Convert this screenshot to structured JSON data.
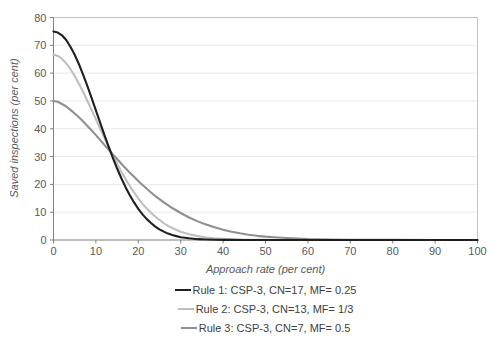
{
  "chart_data": {
    "type": "line",
    "title": "",
    "xlabel": "Approach rate (per cent)",
    "ylabel": "Saved inspections (per cent)",
    "xlim": [
      0,
      100
    ],
    "ylim": [
      0,
      80
    ],
    "x_ticks": [
      0,
      10,
      20,
      30,
      40,
      50,
      60,
      70,
      80,
      90,
      100
    ],
    "y_ticks": [
      0,
      10,
      20,
      30,
      40,
      50,
      60,
      70,
      80
    ],
    "grid": "horizontal-faint",
    "legend_position": "bottom-stacked-centered",
    "series": [
      {
        "name": "Rule 1: CSP-3, CN=17, MF= 0.25",
        "color": "#1f1f1f",
        "points": [
          [
            0,
            75
          ],
          [
            1,
            74.6
          ],
          [
            2,
            73.6
          ],
          [
            3,
            71.9
          ],
          [
            4,
            69.5
          ],
          [
            5,
            66.6
          ],
          [
            6,
            63.2
          ],
          [
            7,
            59.4
          ],
          [
            8,
            55.3
          ],
          [
            9,
            51.0
          ],
          [
            10,
            46.6
          ],
          [
            11,
            42.2
          ],
          [
            12,
            37.8
          ],
          [
            13,
            33.6
          ],
          [
            14,
            29.5
          ],
          [
            15,
            25.7
          ],
          [
            16,
            22.2
          ],
          [
            17,
            19.0
          ],
          [
            18,
            16.1
          ],
          [
            19,
            13.5
          ],
          [
            20,
            11.2
          ],
          [
            21,
            9.2
          ],
          [
            22,
            7.5
          ],
          [
            23,
            6.1
          ],
          [
            24,
            4.8
          ],
          [
            25,
            3.8
          ],
          [
            26,
            3.0
          ],
          [
            27,
            2.3
          ],
          [
            28,
            1.8
          ],
          [
            29,
            1.4
          ],
          [
            30,
            1.0
          ],
          [
            32,
            0.6
          ],
          [
            34,
            0.3
          ],
          [
            36,
            0.2
          ],
          [
            38,
            0.1
          ],
          [
            40,
            0.05
          ],
          [
            45,
            0
          ],
          [
            50,
            0
          ],
          [
            60,
            0
          ],
          [
            70,
            0
          ],
          [
            80,
            0
          ],
          [
            90,
            0
          ],
          [
            100,
            0
          ]
        ]
      },
      {
        "name": "Rule 2: CSP-3, CN=13, MF= 1/3",
        "color": "#bfbfbf",
        "points": [
          [
            0,
            66.7
          ],
          [
            1,
            66.2
          ],
          [
            2,
            65.1
          ],
          [
            3,
            63.5
          ],
          [
            4,
            61.4
          ],
          [
            5,
            59.0
          ],
          [
            6,
            56.2
          ],
          [
            7,
            53.2
          ],
          [
            8,
            50.0
          ],
          [
            9,
            46.8
          ],
          [
            10,
            43.4
          ],
          [
            11,
            40.1
          ],
          [
            12,
            36.8
          ],
          [
            13,
            33.5
          ],
          [
            14,
            30.4
          ],
          [
            15,
            27.4
          ],
          [
            16,
            24.5
          ],
          [
            17,
            21.9
          ],
          [
            18,
            19.4
          ],
          [
            19,
            17.1
          ],
          [
            20,
            15.0
          ],
          [
            21,
            13.0
          ],
          [
            22,
            11.3
          ],
          [
            23,
            9.8
          ],
          [
            24,
            8.4
          ],
          [
            25,
            7.2
          ],
          [
            26,
            6.1
          ],
          [
            27,
            5.1
          ],
          [
            28,
            4.3
          ],
          [
            29,
            3.6
          ],
          [
            30,
            3.0
          ],
          [
            32,
            2.1
          ],
          [
            34,
            1.4
          ],
          [
            36,
            0.9
          ],
          [
            38,
            0.6
          ],
          [
            40,
            0.4
          ],
          [
            45,
            0.1
          ],
          [
            50,
            0.05
          ],
          [
            55,
            0
          ],
          [
            60,
            0
          ],
          [
            70,
            0
          ],
          [
            80,
            0
          ],
          [
            90,
            0
          ],
          [
            100,
            0
          ]
        ]
      },
      {
        "name": "Rule 3: CSP-3, CN=7, MF= 0.5",
        "color": "#8f8f8f",
        "points": [
          [
            0,
            50
          ],
          [
            1,
            49.7
          ],
          [
            2,
            48.9
          ],
          [
            3,
            48.0
          ],
          [
            4,
            46.8
          ],
          [
            5,
            45.5
          ],
          [
            6,
            44.1
          ],
          [
            7,
            42.6
          ],
          [
            8,
            41.0
          ],
          [
            9,
            39.4
          ],
          [
            10,
            37.7
          ],
          [
            11,
            36.0
          ],
          [
            12,
            34.2
          ],
          [
            13,
            32.5
          ],
          [
            14,
            30.8
          ],
          [
            15,
            29.1
          ],
          [
            16,
            27.4
          ],
          [
            17,
            25.8
          ],
          [
            18,
            24.2
          ],
          [
            19,
            22.7
          ],
          [
            20,
            21.2
          ],
          [
            21,
            19.8
          ],
          [
            22,
            18.4
          ],
          [
            23,
            17.1
          ],
          [
            24,
            15.8
          ],
          [
            25,
            14.7
          ],
          [
            26,
            13.5
          ],
          [
            27,
            12.5
          ],
          [
            28,
            11.5
          ],
          [
            29,
            10.6
          ],
          [
            30,
            9.7
          ],
          [
            32,
            8.1
          ],
          [
            34,
            6.7
          ],
          [
            36,
            5.6
          ],
          [
            38,
            4.6
          ],
          [
            40,
            3.7
          ],
          [
            42,
            3.0
          ],
          [
            44,
            2.4
          ],
          [
            46,
            1.9
          ],
          [
            48,
            1.5
          ],
          [
            50,
            1.2
          ],
          [
            52,
            1.0
          ],
          [
            55,
            0.7
          ],
          [
            60,
            0.3
          ],
          [
            65,
            0.2
          ],
          [
            70,
            0.1
          ],
          [
            80,
            0.05
          ],
          [
            90,
            0
          ],
          [
            100,
            0
          ]
        ]
      }
    ]
  },
  "styles": {
    "axis_color": "#7f7f7f",
    "plot_border_color": "#c2c2c2",
    "grid_color": "#e9e9e9",
    "tick_label_color": "#595959",
    "axis_title_color": "#595959",
    "legend_text_color": "#404040",
    "background": "#ffffff"
  }
}
